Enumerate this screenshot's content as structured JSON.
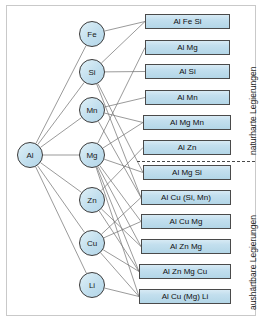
{
  "diagram": {
    "root": {
      "label": "Al",
      "cx": 30,
      "cy": 155,
      "r": 13
    },
    "elements": [
      {
        "id": "fe",
        "label": "Fe",
        "cx": 92,
        "cy": 34,
        "r": 13
      },
      {
        "id": "si",
        "label": "Si",
        "cx": 92,
        "cy": 72,
        "r": 13
      },
      {
        "id": "mn",
        "label": "Mn",
        "cx": 92,
        "cy": 110,
        "r": 13
      },
      {
        "id": "mg",
        "label": "Mg",
        "cx": 92,
        "cy": 155,
        "r": 13
      },
      {
        "id": "zn",
        "label": "Zn",
        "cx": 92,
        "cy": 200,
        "r": 13
      },
      {
        "id": "cu",
        "label": "Cu",
        "cx": 92,
        "cy": 243,
        "r": 13
      },
      {
        "id": "li",
        "label": "Li",
        "cx": 92,
        "cy": 285,
        "r": 13
      }
    ],
    "alloys": [
      {
        "id": "a1",
        "label": "Al Fe Si",
        "x": 145,
        "y": 14,
        "w": 85,
        "h": 15,
        "group": "naturhart"
      },
      {
        "id": "a2",
        "label": "Al Mg",
        "x": 145,
        "y": 40,
        "w": 85,
        "h": 15,
        "group": "naturhart"
      },
      {
        "id": "a3",
        "label": "Al Si",
        "x": 145,
        "y": 64,
        "w": 85,
        "h": 15,
        "group": "naturhart"
      },
      {
        "id": "a4",
        "label": "Al Mn",
        "x": 145,
        "y": 90,
        "w": 85,
        "h": 15,
        "group": "naturhart"
      },
      {
        "id": "a5",
        "label": "Al Mg Mn",
        "x": 143,
        "y": 115,
        "w": 88,
        "h": 15,
        "group": "naturhart"
      },
      {
        "id": "a6",
        "label": "Al Zn",
        "x": 143,
        "y": 140,
        "w": 88,
        "h": 15,
        "group": "naturhart"
      },
      {
        "id": "a7",
        "label": "Al Mg Si",
        "x": 143,
        "y": 165,
        "w": 88,
        "h": 15,
        "group": "aushaertbar"
      },
      {
        "id": "a8",
        "label": "Al Cu (Si, Mn)",
        "x": 141,
        "y": 190,
        "w": 90,
        "h": 15,
        "group": "aushaertbar"
      },
      {
        "id": "a9",
        "label": "Al Cu Mg",
        "x": 141,
        "y": 214,
        "w": 90,
        "h": 15,
        "group": "aushaertbar"
      },
      {
        "id": "a10",
        "label": "Al Zn Mg",
        "x": 141,
        "y": 239,
        "w": 90,
        "h": 15,
        "group": "aushaertbar"
      },
      {
        "id": "a11",
        "label": "Al Zn Mg Cu",
        "x": 139,
        "y": 264,
        "w": 92,
        "h": 15,
        "group": "aushaertbar"
      },
      {
        "id": "a12",
        "label": "Al Cu (Mg) Li",
        "x": 139,
        "y": 289,
        "w": 92,
        "h": 15,
        "group": "aushaertbar"
      }
    ],
    "divider": {
      "x": 137,
      "y": 161,
      "w": 118
    },
    "side_labels": [
      {
        "id": "naturhart",
        "text": "naturharte Legierungen",
        "x": 248,
        "y": 155
      },
      {
        "id": "aushaertbar",
        "text": "aushärtbare Legierungen",
        "x": 248,
        "y": 310
      }
    ],
    "edges": [
      {
        "from": "root",
        "to": "fe"
      },
      {
        "from": "root",
        "to": "si"
      },
      {
        "from": "root",
        "to": "mn"
      },
      {
        "from": "root",
        "to": "mg"
      },
      {
        "from": "root",
        "to": "zn"
      },
      {
        "from": "root",
        "to": "cu"
      },
      {
        "from": "root",
        "to": "li"
      },
      {
        "from": "fe",
        "to": "a1"
      },
      {
        "from": "si",
        "to": "a1"
      },
      {
        "from": "si",
        "to": "a3"
      },
      {
        "from": "si",
        "to": "a7"
      },
      {
        "from": "si",
        "to": "a8"
      },
      {
        "from": "mn",
        "to": "a4"
      },
      {
        "from": "mn",
        "to": "a5"
      },
      {
        "from": "mn",
        "to": "a8"
      },
      {
        "from": "mg",
        "to": "a2"
      },
      {
        "from": "mg",
        "to": "a5"
      },
      {
        "from": "mg",
        "to": "a7"
      },
      {
        "from": "mg",
        "to": "a9"
      },
      {
        "from": "mg",
        "to": "a10"
      },
      {
        "from": "mg",
        "to": "a11"
      },
      {
        "from": "mg",
        "to": "a12"
      },
      {
        "from": "zn",
        "to": "a6"
      },
      {
        "from": "zn",
        "to": "a10"
      },
      {
        "from": "zn",
        "to": "a11"
      },
      {
        "from": "cu",
        "to": "a8"
      },
      {
        "from": "cu",
        "to": "a9"
      },
      {
        "from": "cu",
        "to": "a11"
      },
      {
        "from": "cu",
        "to": "a12"
      },
      {
        "from": "li",
        "to": "a12"
      }
    ],
    "colors": {
      "node_fill": "#c2dfee",
      "node_stroke": "#3a3a3a",
      "box_fill": "#c3dfee",
      "box_stroke": "#4a4a4a",
      "edge_stroke": "#6e6e6e",
      "frame_stroke": "#c9c9c9",
      "text": "#101010"
    }
  }
}
